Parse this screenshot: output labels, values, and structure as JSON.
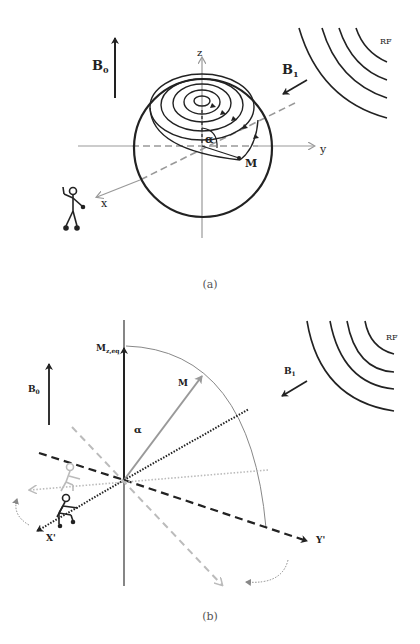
{
  "figure_a": {
    "caption": "(a)",
    "labels": {
      "b0": "B",
      "b0_sub": "0",
      "b1": "B",
      "b1_sub": "1",
      "rf": "RF",
      "z_axis": "z",
      "y_axis": "y",
      "x_axis": "x",
      "magnetization": "M",
      "flip_angle": "α"
    },
    "colors": {
      "dark": "#222222",
      "gray": "#999999"
    }
  },
  "figure_b": {
    "caption": "(b)",
    "labels": {
      "b0": "B",
      "b0_sub": "0",
      "b1": "B",
      "b1_sub": "1",
      "rf": "RF",
      "mz_eq": "M",
      "mz_eq_sub": "z,eq",
      "magnetization": "M",
      "flip_angle": "α",
      "x_prime": "X'",
      "y_prime": "Y'"
    },
    "colors": {
      "dark": "#222222",
      "gray": "#999999",
      "light": "#bbbbbb"
    }
  }
}
